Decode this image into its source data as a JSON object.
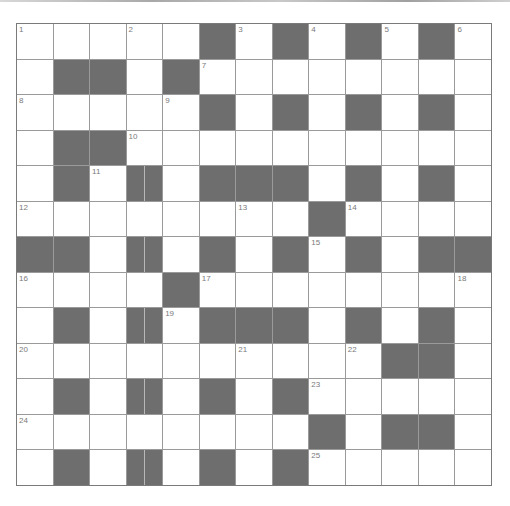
{
  "puzzle": {
    "type": "crossword",
    "rows": 13,
    "cols": 13,
    "colors": {
      "black": "#6e6e6e",
      "white": "#ffffff",
      "gridline": "#9a9a9a",
      "number": "#7a7a7a"
    },
    "layout": [
      ".....#.#.#.#.",
      ".##.#........",
      ".....#.#.#.#.",
      ".##..........",
      ".#.|.###.#.#.",
      "........#....",
      "##.|.#.#.#.##",
      "....#........",
      ".#.|.###.#.#.",
      "..........##.",
      ".#.|.#.#.....",
      "........#.##.",
      ".#.|.#.#....."
    ],
    "numbers": [
      {
        "n": "1",
        "r": 0,
        "c": 0
      },
      {
        "n": "2",
        "r": 0,
        "c": 3
      },
      {
        "n": "3",
        "r": 0,
        "c": 6
      },
      {
        "n": "4",
        "r": 0,
        "c": 8
      },
      {
        "n": "5",
        "r": 0,
        "c": 10
      },
      {
        "n": "6",
        "r": 0,
        "c": 12
      },
      {
        "n": "7",
        "r": 1,
        "c": 5
      },
      {
        "n": "8",
        "r": 2,
        "c": 0
      },
      {
        "n": "9",
        "r": 2,
        "c": 4
      },
      {
        "n": "10",
        "r": 3,
        "c": 3
      },
      {
        "n": "11",
        "r": 4,
        "c": 2
      },
      {
        "n": "12",
        "r": 5,
        "c": 0
      },
      {
        "n": "13",
        "r": 5,
        "c": 6
      },
      {
        "n": "14",
        "r": 5,
        "c": 9
      },
      {
        "n": "15",
        "r": 6,
        "c": 8
      },
      {
        "n": "16",
        "r": 7,
        "c": 0
      },
      {
        "n": "17",
        "r": 7,
        "c": 5
      },
      {
        "n": "18",
        "r": 7,
        "c": 12
      },
      {
        "n": "19",
        "r": 8,
        "c": 4
      },
      {
        "n": "20",
        "r": 9,
        "c": 0
      },
      {
        "n": "21",
        "r": 9,
        "c": 6
      },
      {
        "n": "22",
        "r": 9,
        "c": 9
      },
      {
        "n": "23",
        "r": 10,
        "c": 8
      },
      {
        "n": "24",
        "r": 11,
        "c": 0
      },
      {
        "n": "25",
        "r": 12,
        "c": 8
      }
    ],
    "legend": {
      ".": "white cell",
      "#": "black cell",
      "|": "black cell with center divider line"
    }
  }
}
